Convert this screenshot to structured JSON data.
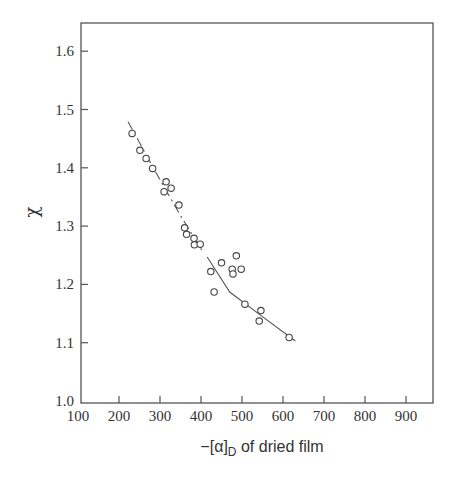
{
  "chart_data": {
    "type": "scatter",
    "title": "",
    "xlabel": "−[α]D of dried film",
    "xlabel_main": "−[α]",
    "xlabel_sub": "D",
    "xlabel_rest": " of dried film",
    "ylabel": "χ",
    "xlim": [
      100,
      960
    ],
    "ylim": [
      1.0,
      1.65
    ],
    "xticks": [
      100,
      200,
      300,
      400,
      500,
      600,
      700,
      800,
      900
    ],
    "yticks": [
      1.0,
      1.1,
      1.2,
      1.3,
      1.4,
      1.5,
      1.6
    ],
    "ytick_labels": [
      "1.0",
      "1.1",
      "1.2",
      "1.3",
      "1.4",
      "1.5",
      "1.6"
    ],
    "grid": false,
    "legend": null,
    "series": [
      {
        "name": "data",
        "marker": "open-circle",
        "points": [
          [
            232,
            1.459
          ],
          [
            251,
            1.43
          ],
          [
            266,
            1.416
          ],
          [
            282,
            1.399
          ],
          [
            315,
            1.376
          ],
          [
            327,
            1.365
          ],
          [
            310,
            1.359
          ],
          [
            346,
            1.336
          ],
          [
            360,
            1.297
          ],
          [
            365,
            1.286
          ],
          [
            383,
            1.279
          ],
          [
            384,
            1.268
          ],
          [
            398,
            1.269
          ],
          [
            424,
            1.222
          ],
          [
            450,
            1.237
          ],
          [
            486,
            1.249
          ],
          [
            476,
            1.226
          ],
          [
            478,
            1.218
          ],
          [
            498,
            1.226
          ],
          [
            432,
            1.187
          ],
          [
            507,
            1.166
          ],
          [
            546,
            1.155
          ],
          [
            542,
            1.137
          ],
          [
            615,
            1.109
          ]
        ]
      }
    ],
    "fit_lines": [
      {
        "name": "fit-segment-1",
        "style": "dashed-dot",
        "points": [
          [
            222,
            1.479
          ],
          [
            290,
            1.392
          ],
          [
            350,
            1.318
          ],
          [
            405,
            1.255
          ]
        ]
      },
      {
        "name": "fit-segment-2",
        "style": "solid",
        "points": [
          [
            415,
            1.247
          ],
          [
            470,
            1.187
          ],
          [
            540,
            1.15
          ],
          [
            630,
            1.103
          ]
        ]
      }
    ]
  }
}
